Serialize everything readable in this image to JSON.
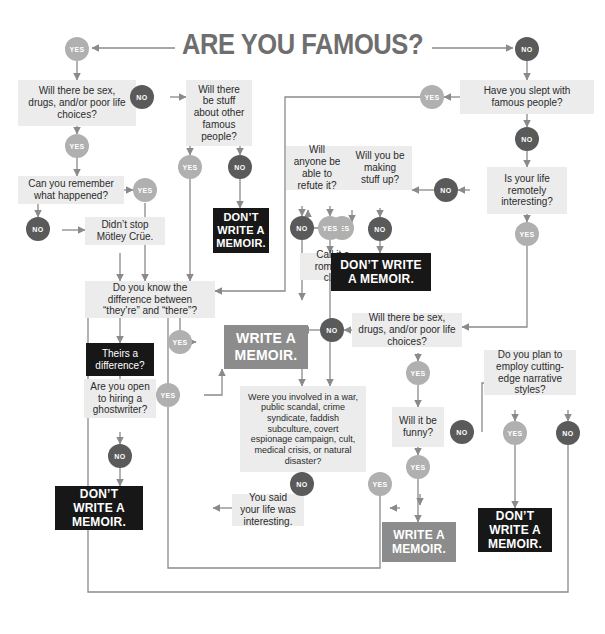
{
  "title": "ARE YOU FAMOUS?",
  "colors": {
    "box_bg": "#ececec",
    "dark_box": "#171717",
    "gray_box": "#8c8c8c",
    "yes_pill": "#b0b0b0",
    "no_pill": "#5a5a5a",
    "title_text": "#6e6e6e",
    "line": "#8a8a8a"
  },
  "labels": {
    "yes": "YES",
    "no": "NO"
  },
  "nodes": {
    "q_sex_drugs_1": "Will there be sex, drugs, and/or poor life choices?",
    "q_other_famous": "Will there be stuff about other famous people?",
    "q_remember": "Can you remember what happened?",
    "s_motley": "Didn’t stop Mötley Crüe.",
    "q_slept_famous": "Have you slept with famous people?",
    "q_remotely_interesting": "Is your life remotely interesting?",
    "q_making_stuff_up": "Will you be making stuff up?",
    "q_refute": "Will anyone be able to refute it?",
    "s_roman": "Call it a roman à clef.",
    "q_theyre_there": "Do you know the difference between “they’re” and “there”?",
    "p_theirs": "Theirs a difference?",
    "q_ghostwriter": "Are you open to hiring a ghostwriter?",
    "q_sex_drugs_2": "Will there be sex, drugs, and/or poor life choices?",
    "q_involved": "Were you involved in a war, public scandal, crime syndicate, faddish subculture, covert espionage campaign, cult, medical crisis, or natural disaster?",
    "q_funny": "Will it be funny?",
    "q_cutting_edge": "Do you plan to employ cutting-edge narrative styles?",
    "s_you_said": "You said your life was interesting.",
    "v_dont_1": "DON’T WRITE A MEMOIR.",
    "v_dont_2": "DON’T WRITE A MEMOIR.",
    "v_dont_3": "DON’T WRITE A MEMOIR.",
    "v_dont_4": "DON’T WRITE A MEMOIR.",
    "v_write_1": "WRITE A MEMOIR.",
    "v_write_2": "WRITE A MEMOIR."
  }
}
